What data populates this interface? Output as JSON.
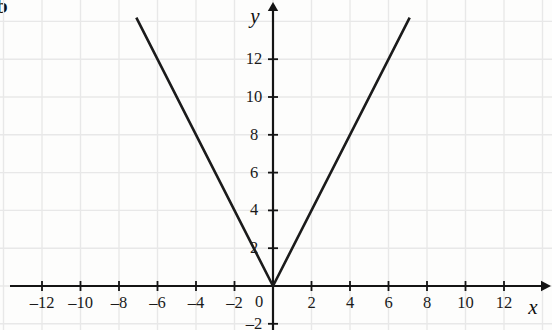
{
  "figure": {
    "part_label": "b",
    "background_color": "#fdfdfc",
    "grid_color": "#e8e8e8",
    "axis_color": "#141414",
    "curve_color": "#1b1b1b"
  },
  "chart_data": {
    "type": "line",
    "title": "",
    "subtitle": "",
    "xlabel": "x",
    "ylabel": "y",
    "equation": "y = |2x|",
    "grid": true,
    "grid_step_x": 2,
    "grid_step_y": 2,
    "legend": "none",
    "xlim": [
      -13.5,
      13.5
    ],
    "ylim": [
      -2.3,
      13.5
    ],
    "xticks": [
      -12,
      -10,
      -8,
      -6,
      -4,
      -2,
      0,
      2,
      4,
      6,
      8,
      10,
      12
    ],
    "yticks": [
      -2,
      2,
      4,
      6,
      8,
      10,
      12
    ],
    "xtick_labels": [
      "–12",
      "–10",
      "–8",
      "–6",
      "–4",
      "–2",
      "0",
      "2",
      "4",
      "6",
      "8",
      "10",
      "12"
    ],
    "ytick_labels": [
      "–2",
      "2",
      "4",
      "6",
      "8",
      "10",
      "12"
    ],
    "origin_label": "0",
    "series": [
      {
        "name": "y = |2x|",
        "points": [
          [
            -7.1,
            14.2
          ],
          [
            0,
            0
          ],
          [
            7.1,
            14.2
          ]
        ]
      }
    ],
    "annotations": []
  }
}
